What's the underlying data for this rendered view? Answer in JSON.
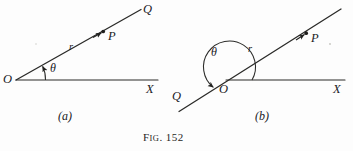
{
  "figure": {
    "caption_prefix": "F",
    "caption_smallcaps": "IG",
    "caption_dot": ".",
    "caption_number": "152",
    "caption_full": "Fig. 152",
    "panels": [
      {
        "id": "a",
        "sublabel": "(a)",
        "description": "Acute angle theta measured counterclockwise from ray OX to ray OQ",
        "labels": {
          "origin": "O",
          "axis": "X",
          "terminal": "Q",
          "point": "P",
          "radius": "r",
          "angle": "θ"
        },
        "geometry": {
          "origin": [
            16,
            80
          ],
          "axis_end": [
            158,
            80
          ],
          "ray_end": [
            140,
            10
          ],
          "point_p": [
            104,
            31
          ],
          "arc_radius": 28,
          "angle_degrees": 26
        }
      },
      {
        "id": "b",
        "sublabel": "(b)",
        "description": "Obtuse angle theta measured counterclockwise from ray OX to ray OQ directed into the third quadrant",
        "labels": {
          "origin": "O",
          "axis": "X",
          "terminal": "Q",
          "point": "P",
          "radius": "r",
          "angle": "θ"
        },
        "geometry": {
          "origin": [
            226,
            80
          ],
          "axis_end": [
            345,
            80
          ],
          "ray_end": [
            340,
            10
          ],
          "ray_back_end": [
            178,
            112
          ],
          "point_p": [
            306,
            33
          ],
          "arc_radius": 26,
          "angle_degrees": 205
        }
      }
    ],
    "colors": {
      "ink": "#20201e",
      "paper": "#fdfdfd",
      "line": "#2a2a28"
    }
  }
}
